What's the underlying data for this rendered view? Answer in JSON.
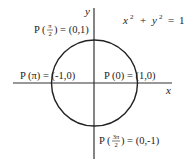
{
  "diagram": {
    "equation": {
      "x": "x",
      "exp1": "2",
      "plus": "+",
      "y": "y",
      "exp2": "2",
      "eq": "=",
      "rhs": "1"
    },
    "axes": {
      "x_label": "x",
      "y_label": "y"
    },
    "points": {
      "top": {
        "prefix": "P (",
        "num": "π",
        "den": "2",
        "suffix": ") = (0,1)"
      },
      "left": {
        "text": "P (π) = (-1,0)"
      },
      "right": {
        "text": "P (0) = (1,0)"
      },
      "bottom": {
        "prefix": "P (",
        "num": "3π",
        "den": "2",
        "suffix": ") = (0,-1)"
      }
    },
    "colors": {
      "stroke": "#222222",
      "background": "#ffffff"
    }
  }
}
